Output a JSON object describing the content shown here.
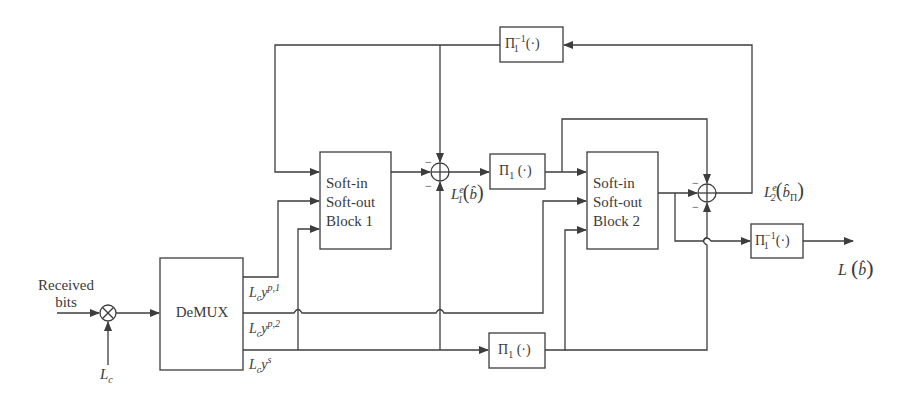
{
  "diagram": {
    "type": "block-diagram",
    "input": {
      "received_label_line1": "Received",
      "received_label_line2": "bits",
      "multiplier_symbol": "⊗",
      "scaling_label_base": "L",
      "scaling_label_sub": "c"
    },
    "blocks": {
      "demux": {
        "label": "DeMUX"
      },
      "siso1": {
        "line1": "Soft-in",
        "line2": "Soft-out",
        "line3": "Block 1"
      },
      "siso2": {
        "line1": "Soft-in",
        "line2": "Soft-out",
        "line3": "Block 2"
      },
      "interleaver_extrinsic": {
        "base": "Π",
        "sub": "1",
        "args": "(·)"
      },
      "interleaver_systematic": {
        "base": "Π",
        "sub": "1",
        "args": "(·)"
      },
      "deinterleaver_feedback": {
        "base": "Π",
        "sub": "1",
        "sup": "−1",
        "args": "(·)"
      },
      "deinterleaver_output": {
        "base": "Π",
        "sub": "1",
        "sup": "−1",
        "args": "(·)"
      }
    },
    "demux_outputs": [
      {
        "base": "L",
        "sub": "c",
        "var": "y",
        "sup": "p,1"
      },
      {
        "base": "L",
        "sub": "c",
        "var": "y",
        "sup": "p,2"
      },
      {
        "base": "L",
        "sub": "c",
        "var": "y",
        "sup": "s"
      }
    ],
    "summing_junctions": {
      "sum1": {
        "signs": [
          "−",
          "−"
        ],
        "output_label": {
          "base": "L",
          "sup": "e",
          "sub": "1",
          "arg": "b̂"
        }
      },
      "sum2": {
        "signs": [
          "−",
          "−"
        ],
        "output_label": {
          "base": "L",
          "sup": "e",
          "sub": "2",
          "arg": "b̂",
          "arg_sub": "Π"
        }
      }
    },
    "output": {
      "base": "L",
      "arg": "b̂"
    }
  }
}
